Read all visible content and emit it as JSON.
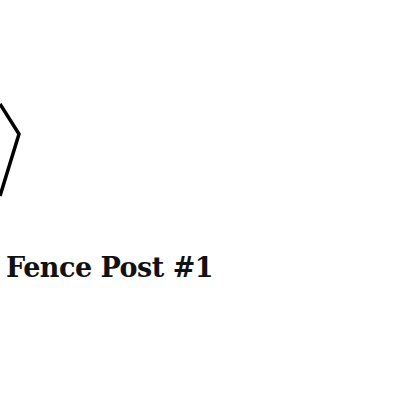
{
  "diagram": {
    "label": "Fence Post #1",
    "stroke_color": "#000000",
    "text_color": "#111111",
    "background": "#ffffff"
  }
}
